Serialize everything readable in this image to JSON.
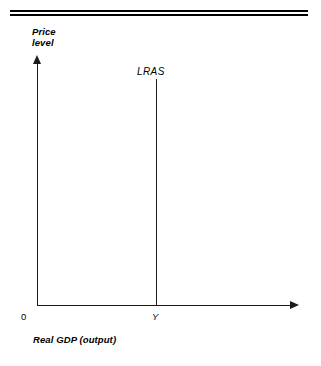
{
  "figure": {
    "y_axis_title_line1": "Price",
    "y_axis_title_line2": "level",
    "x_axis_title": "Real GDP (output)",
    "curve_label": "LRAS",
    "origin_label": "0",
    "equilibrium_tick_label": "Y",
    "line_color": "#1a1a1a",
    "rule_color": "#000000",
    "background_color": "#ffffff"
  },
  "chart_data": {
    "type": "line",
    "title": "",
    "subtitle": "",
    "xlabel": "Real GDP (output)",
    "ylabel": "Price level",
    "xlim": [
      0,
      1
    ],
    "ylim": [
      0,
      1
    ],
    "grid": false,
    "legend": "none",
    "xticks": [
      "0",
      "Y"
    ],
    "xtick_values": [
      0,
      0.47
    ],
    "yticks": [],
    "series": [
      {
        "name": "LRAS",
        "type": "vertical-line",
        "x": [
          0.47,
          0.47
        ],
        "y": [
          0.0,
          0.93
        ],
        "label_position": "above-top",
        "description": "Long-run aggregate supply is vertical at potential output Y"
      }
    ],
    "annotations": [
      {
        "text": "LRAS",
        "x": 0.4,
        "y": 1.0
      }
    ]
  }
}
